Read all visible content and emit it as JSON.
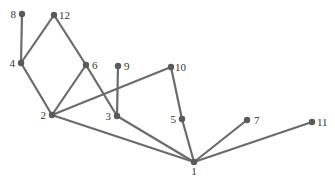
{
  "diagram": {
    "type": "graph",
    "colors": {
      "edge": "#6b6b6b",
      "node": "#5a5a5a",
      "label": "#333333",
      "background": "#ffffff"
    },
    "nodes": [
      {
        "id": "1",
        "label": "1",
        "x": 194,
        "y": 162,
        "lx": 194,
        "ly": 175,
        "anchor": "middle"
      },
      {
        "id": "2",
        "label": "2",
        "x": 52,
        "y": 115,
        "lx": 46,
        "ly": 119,
        "anchor": "end"
      },
      {
        "id": "3",
        "label": "3",
        "x": 117,
        "y": 116,
        "lx": 111,
        "ly": 120,
        "anchor": "end"
      },
      {
        "id": "4",
        "label": "4",
        "x": 21,
        "y": 63,
        "lx": 15,
        "ly": 67,
        "anchor": "end"
      },
      {
        "id": "5",
        "label": "5",
        "x": 182,
        "y": 119,
        "lx": 176,
        "ly": 123,
        "anchor": "end"
      },
      {
        "id": "6",
        "label": "6",
        "x": 86,
        "y": 65,
        "lx": 92,
        "ly": 69,
        "anchor": "start"
      },
      {
        "id": "7",
        "label": "7",
        "x": 247,
        "y": 120,
        "lx": 254,
        "ly": 124,
        "anchor": "start"
      },
      {
        "id": "8",
        "label": "8",
        "x": 22,
        "y": 14,
        "lx": 16,
        "ly": 18,
        "anchor": "end"
      },
      {
        "id": "9",
        "label": "9",
        "x": 118,
        "y": 66,
        "lx": 124,
        "ly": 70,
        "anchor": "start"
      },
      {
        "id": "10",
        "label": "10",
        "x": 171,
        "y": 67,
        "lx": 175,
        "ly": 71,
        "anchor": "start"
      },
      {
        "id": "11",
        "label": "11",
        "x": 312,
        "y": 122,
        "lx": 317,
        "ly": 126,
        "anchor": "start"
      },
      {
        "id": "12",
        "label": "12",
        "x": 54,
        "y": 15,
        "lx": 59,
        "ly": 19,
        "anchor": "start"
      }
    ],
    "edges": [
      [
        "8",
        "4"
      ],
      [
        "4",
        "12"
      ],
      [
        "12",
        "6"
      ],
      [
        "4",
        "2"
      ],
      [
        "6",
        "2"
      ],
      [
        "6",
        "3"
      ],
      [
        "2",
        "10"
      ],
      [
        "2",
        "1"
      ],
      [
        "9",
        "3"
      ],
      [
        "3",
        "1"
      ],
      [
        "10",
        "5"
      ],
      [
        "5",
        "1"
      ],
      [
        "7",
        "1"
      ],
      [
        "11",
        "1"
      ]
    ]
  }
}
